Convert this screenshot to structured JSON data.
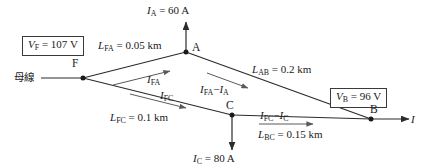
{
  "diagram": {
    "bus_label": "母線",
    "nodes": [
      {
        "id": "F",
        "label": "F",
        "x": 83,
        "y": 78
      },
      {
        "id": "A",
        "label": "A",
        "x": 186,
        "y": 52
      },
      {
        "id": "C",
        "label": "C",
        "x": 232,
        "y": 115
      },
      {
        "id": "B",
        "label": "B",
        "x": 371,
        "y": 119
      }
    ],
    "voltages": [
      {
        "name": "V_F",
        "label": "Vᶠ = 107 V",
        "symbol": "V",
        "sub": "F",
        "value": "107",
        "unit": "V",
        "text": "V_F = 107 V"
      },
      {
        "name": "V_B",
        "label": "Vᴮ = 96 V",
        "symbol": "V",
        "sub": "B",
        "value": "96",
        "unit": "V",
        "text": "V_B = 96 V"
      }
    ],
    "lengths": [
      {
        "name": "L_FA",
        "symbol": "L",
        "sub": "FA",
        "value": "0.05",
        "unit": "km",
        "text": "L_FA = 0.05 km"
      },
      {
        "name": "L_AB",
        "symbol": "L",
        "sub": "AB",
        "value": "0.2",
        "unit": "km",
        "text": "L_AB = 0.2 km"
      },
      {
        "name": "L_FC",
        "symbol": "L",
        "sub": "FC",
        "value": "0.1",
        "unit": "km",
        "text": "L_FC = 0.1 km"
      },
      {
        "name": "L_BC",
        "symbol": "L",
        "sub": "BC",
        "value": "0.15",
        "unit": "km",
        "text": "L_BC = 0.15 km"
      }
    ],
    "load_currents": [
      {
        "name": "I_A",
        "symbol": "I",
        "sub": "A",
        "value": "60",
        "unit": "A",
        "text": "I_A = 60 A"
      },
      {
        "name": "I_C",
        "symbol": "I",
        "sub": "C",
        "value": "80",
        "unit": "A",
        "text": "I_C = 80 A"
      }
    ],
    "branch_currents": [
      {
        "name": "I_FA",
        "text": "I_FA"
      },
      {
        "name": "I_FC",
        "text": "I_FC"
      },
      {
        "name": "I_FA_minus_I_A",
        "text": "I_FA − I_A"
      },
      {
        "name": "I_FC_minus_I_C",
        "text": "I_FC − I_C"
      }
    ],
    "source_current": {
      "name": "I",
      "text": "I"
    },
    "colors": {
      "line": "#2b2b2b",
      "text": "#1a1a1a",
      "box_border": "#3a3a3a",
      "arrow_thin": "#5a5a5a",
      "background": "#ffffff"
    }
  }
}
